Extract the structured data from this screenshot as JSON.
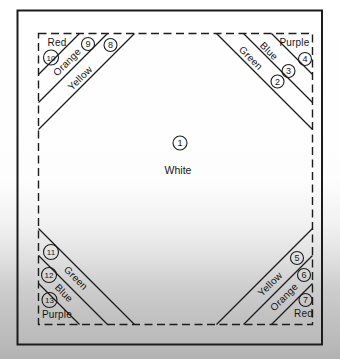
{
  "diagram": {
    "center": {
      "number": "1",
      "color": "White"
    },
    "top_left": {
      "pieces": [
        {
          "number": "8",
          "color": "Yellow"
        },
        {
          "number": "9",
          "color": "Orange"
        },
        {
          "number": "10",
          "color": "Red"
        }
      ]
    },
    "top_right": {
      "pieces": [
        {
          "number": "2",
          "color": "Green"
        },
        {
          "number": "3",
          "color": "Blue"
        },
        {
          "number": "4",
          "color": "Purple"
        }
      ]
    },
    "bottom_right": {
      "pieces": [
        {
          "number": "5",
          "color": "Yellow"
        },
        {
          "number": "6",
          "color": "Orange"
        },
        {
          "number": "7",
          "color": "Red"
        }
      ]
    },
    "bottom_left": {
      "pieces": [
        {
          "number": "11",
          "color": "Green"
        },
        {
          "number": "12",
          "color": "Blue"
        },
        {
          "number": "13",
          "color": "Purple"
        }
      ]
    },
    "colors": {
      "line": "#1c1c1c",
      "page_top": "#ffffff",
      "page_bottom": "#b2b2b2"
    }
  }
}
